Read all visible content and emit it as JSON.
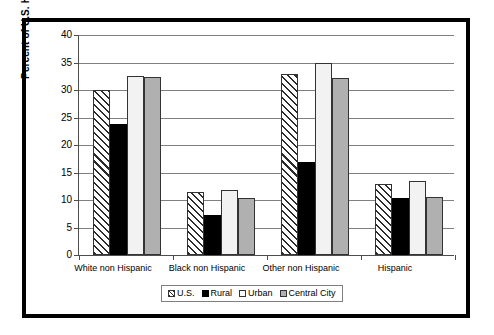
{
  "chart_data": {
    "type": "bar",
    "title": "",
    "xlabel": "",
    "ylabel": "Percent of U.S. Households",
    "ylim": [
      0,
      40
    ],
    "ytick_step": 5,
    "yticks": [
      40,
      35,
      30,
      25,
      20,
      15,
      10,
      5,
      0
    ],
    "grid": true,
    "legend_position": "bottom",
    "categories": [
      "White non Hispanic",
      "Black non Hispanic",
      "Other non Hispanic",
      "Hispanic"
    ],
    "series": [
      {
        "name": "U.S.",
        "values": [
          30.0,
          11.4,
          33.0,
          13.0
        ]
      },
      {
        "name": "Rural",
        "values": [
          23.8,
          7.3,
          16.9,
          10.4
        ]
      },
      {
        "name": "Urban",
        "values": [
          32.5,
          11.8,
          35.0,
          13.4
        ]
      },
      {
        "name": "Central City",
        "values": [
          32.4,
          10.4,
          32.1,
          10.6
        ]
      }
    ],
    "series_fills": [
      "diagonal-hatch",
      "black",
      "white",
      "gray"
    ],
    "colors": {
      "series_us": "#ffffff",
      "series_rural": "#000000",
      "series_urban": "#f2f2f2",
      "series_central_city": "#b0b0b0",
      "axis": "#4d4d4d",
      "gridline": "#808080",
      "border": "#000000",
      "background": "#ffffff"
    }
  }
}
